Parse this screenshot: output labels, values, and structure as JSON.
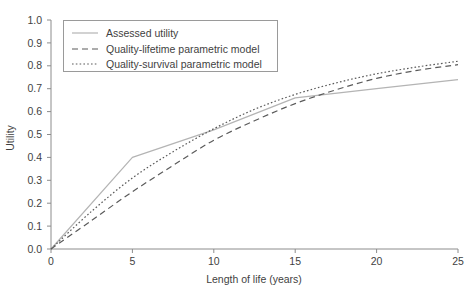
{
  "chart_data": {
    "type": "line",
    "title": "",
    "xlabel": "Length of life (years)",
    "ylabel": "Utility",
    "xlim": [
      0,
      25
    ],
    "ylim": [
      0,
      1.0
    ],
    "xticks": [
      0,
      5,
      10,
      15,
      20,
      25
    ],
    "xtick_labels": [
      "0",
      "5",
      "10",
      "15",
      "20",
      "25"
    ],
    "yticks": [
      0.0,
      0.1,
      0.2,
      0.3,
      0.4,
      0.5,
      0.6,
      0.7,
      0.8,
      0.9,
      1.0
    ],
    "ytick_labels": [
      "0.0",
      "0.1",
      "0.2",
      "0.3",
      "0.4",
      "0.5",
      "0.6",
      "0.7",
      "0.8",
      "0.9",
      "1.0"
    ],
    "grid": false,
    "legend_position": "upper-left",
    "series": [
      {
        "name": "Assessed utility",
        "style": "solid",
        "color": "#b4b4b4",
        "x": [
          0,
          5,
          10,
          15,
          20,
          25
        ],
        "values": [
          0.0,
          0.4,
          0.52,
          0.66,
          0.7,
          0.74
        ]
      },
      {
        "name": "Quality-lifetime parametric model",
        "style": "dashed",
        "color": "#5a5a5a",
        "x": [
          0,
          2.5,
          5,
          7.5,
          10,
          12.5,
          15,
          17.5,
          20,
          22.5,
          25
        ],
        "values": [
          0.0,
          0.125,
          0.25,
          0.365,
          0.475,
          0.56,
          0.635,
          0.695,
          0.745,
          0.78,
          0.805
        ]
      },
      {
        "name": "Quality-survival parametric model",
        "style": "dotted",
        "color": "#5a5a5a",
        "x": [
          0,
          2.5,
          5,
          7.5,
          10,
          12.5,
          15,
          17.5,
          20,
          22.5,
          25
        ],
        "values": [
          0.0,
          0.165,
          0.31,
          0.425,
          0.525,
          0.61,
          0.675,
          0.725,
          0.765,
          0.795,
          0.82
        ]
      }
    ]
  },
  "legend": {
    "items": [
      {
        "label": "Assessed utility"
      },
      {
        "label": "Quality-lifetime parametric model"
      },
      {
        "label": "Quality-survival parametric model"
      }
    ]
  },
  "axes": {
    "x_title": "Length of life (years)",
    "y_title": "Utility",
    "x_tick_labels": [
      "0",
      "5",
      "10",
      "15",
      "20",
      "25"
    ],
    "y_tick_labels": [
      "0.0",
      "0.1",
      "0.2",
      "0.3",
      "0.4",
      "0.5",
      "0.6",
      "0.7",
      "0.8",
      "0.9",
      "1.0"
    ]
  }
}
